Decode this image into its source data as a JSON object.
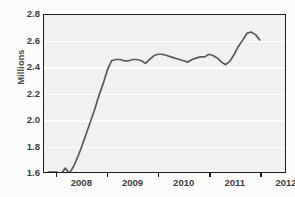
{
  "figure": {
    "clipped_title": "Figure 1.  Enrollment, in millions",
    "ylabel": "Millions"
  },
  "chart_data": {
    "type": "line",
    "title": "",
    "xlabel": "",
    "ylabel": "Millions",
    "ylim": [
      1.6,
      2.8
    ],
    "yticks": [
      1.6,
      1.8,
      2.0,
      2.2,
      2.4,
      2.6,
      2.8
    ],
    "ytick_labels": [
      "1.6",
      "1.8",
      "2.0",
      "2.2",
      "2.4",
      "2.6",
      "2.8"
    ],
    "xlim": [
      2007.5,
      2012.25
    ],
    "xticks": [
      2007.75,
      2008.75,
      2009.75,
      2010.75,
      2011.75
    ],
    "xtick_labels": [
      "2008",
      "2009",
      "2010",
      "2011",
      "2012"
    ],
    "xtick_label_positions": [
      2008.25,
      2009.25,
      2010.25,
      2011.25,
      2012.25
    ],
    "grid": "horizontal-white",
    "legend": "none",
    "line_color": "#595959",
    "plot_background": "#f1f1f1",
    "frame_color": "#1c1c1c",
    "series": [
      {
        "name": "Millions",
        "x": [
          2007.58,
          2007.67,
          2007.75,
          2007.83,
          2007.92,
          2008.0,
          2008.08,
          2008.17,
          2008.25,
          2008.33,
          2008.42,
          2008.5,
          2008.58,
          2008.67,
          2008.75,
          2008.83,
          2008.92,
          2009.0,
          2009.08,
          2009.17,
          2009.25,
          2009.33,
          2009.42,
          2009.5,
          2009.58,
          2009.67,
          2009.75,
          2009.83,
          2009.92,
          2010.0,
          2010.08,
          2010.17,
          2010.25,
          2010.33,
          2010.42,
          2010.5,
          2010.58,
          2010.67,
          2010.75,
          2010.83,
          2010.92,
          2011.0,
          2011.08,
          2011.17,
          2011.25,
          2011.33,
          2011.42,
          2011.5,
          2011.58,
          2011.67,
          2011.75
        ],
        "y": [
          1.6,
          1.6,
          1.6,
          1.58,
          1.63,
          1.59,
          1.64,
          1.72,
          1.8,
          1.89,
          1.99,
          2.08,
          2.18,
          2.28,
          2.38,
          2.45,
          2.46,
          2.46,
          2.45,
          2.45,
          2.46,
          2.46,
          2.45,
          2.43,
          2.46,
          2.49,
          2.5,
          2.5,
          2.49,
          2.48,
          2.47,
          2.46,
          2.45,
          2.44,
          2.46,
          2.47,
          2.48,
          2.48,
          2.5,
          2.49,
          2.47,
          2.44,
          2.42,
          2.45,
          2.5,
          2.56,
          2.61,
          2.66,
          2.67,
          2.65,
          2.61
        ]
      }
    ]
  }
}
